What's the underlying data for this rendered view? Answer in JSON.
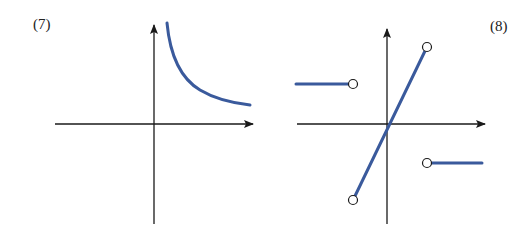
{
  "figures": [
    {
      "label": "(7)",
      "description": "Graph of a decreasing curve in the first quadrant approaching the x-axis asymptotically and the y-axis as x→0+",
      "curve_color": "#3a5a9c"
    },
    {
      "label": "(8)",
      "description": "Piecewise function: constant positive value for x<a (open circle at end), line through origin on (-a,a) with open endpoints, constant negative value for x>a (open circle at start)",
      "curve_color": "#3a5a9c"
    }
  ],
  "colors": {
    "axis": "#1a1a1a",
    "curve": "#3a5a9c"
  }
}
